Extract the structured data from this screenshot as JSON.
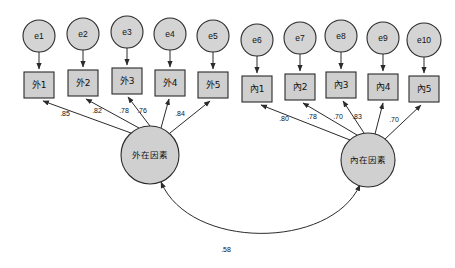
{
  "diagram": {
    "type": "sem-path-diagram",
    "background_color": "#ffffff",
    "stroke_color": "#2b2b2b",
    "node_fill": "#d0d0d0"
  },
  "factors": [
    {
      "id": "left-factor",
      "label": "外在因素",
      "cx": 150,
      "cy": 155,
      "r": 29
    },
    {
      "id": "right-factor",
      "label": "內在因素",
      "cx": 368,
      "cy": 160,
      "r": 27
    }
  ],
  "errors": [
    {
      "label": "e1",
      "cx": 39,
      "cy": 36,
      "r": 16
    },
    {
      "label": "e2",
      "cx": 83,
      "cy": 34,
      "r": 16
    },
    {
      "label": "e3",
      "cx": 127,
      "cy": 32,
      "r": 16
    },
    {
      "label": "e4",
      "cx": 170,
      "cy": 34,
      "r": 16
    },
    {
      "label": "e5",
      "cx": 213,
      "cy": 36,
      "r": 16
    },
    {
      "label": "e6",
      "cx": 257,
      "cy": 40,
      "r": 16
    },
    {
      "label": "e7",
      "cx": 300,
      "cy": 38,
      "r": 16
    },
    {
      "label": "e8",
      "cx": 341,
      "cy": 36,
      "r": 16
    },
    {
      "label": "e9",
      "cx": 383,
      "cy": 38,
      "r": 16
    },
    {
      "label": "e10",
      "cx": 424,
      "cy": 40,
      "r": 17
    }
  ],
  "indicators": [
    {
      "label": "外1",
      "x": 24,
      "y": 72,
      "w": 30,
      "h": 26
    },
    {
      "label": "外2",
      "x": 68,
      "y": 70,
      "w": 30,
      "h": 26
    },
    {
      "label": "外3",
      "x": 112,
      "y": 68,
      "w": 30,
      "h": 26
    },
    {
      "label": "外4",
      "x": 155,
      "y": 70,
      "w": 30,
      "h": 26
    },
    {
      "label": "外5",
      "x": 198,
      "y": 72,
      "w": 30,
      "h": 26
    },
    {
      "label": "內1",
      "x": 242,
      "y": 76,
      "w": 30,
      "h": 26
    },
    {
      "label": "內2",
      "x": 285,
      "y": 74,
      "w": 30,
      "h": 26
    },
    {
      "label": "內3",
      "x": 326,
      "y": 72,
      "w": 30,
      "h": 26
    },
    {
      "label": "內4",
      "x": 368,
      "y": 74,
      "w": 30,
      "h": 26
    },
    {
      "label": "內5",
      "x": 409,
      "y": 76,
      "w": 30,
      "h": 26
    }
  ],
  "loadings": [
    {
      "from": "left-factor",
      "to": "外1",
      "value": ".85",
      "lx": 65,
      "ly": 113
    },
    {
      "from": "left-factor",
      "to": "外2",
      "value": ".82",
      "lx": 97,
      "ly": 110
    },
    {
      "from": "left-factor",
      "to": "外3",
      "value": ".78",
      "lx": 124,
      "ly": 110
    },
    {
      "from": "left-factor",
      "to": "外4",
      "value": ".76",
      "lx": 142,
      "ly": 110
    },
    {
      "from": "left-factor",
      "to": "外5",
      "value": ".84",
      "lx": 180,
      "ly": 113
    },
    {
      "from": "right-factor",
      "to": "內1",
      "value": ".80",
      "lx": 284,
      "ly": 118
    },
    {
      "from": "right-factor",
      "to": "內2",
      "value": ".78",
      "lx": 312,
      "ly": 116
    },
    {
      "from": "right-factor",
      "to": "內3",
      "value": ".70",
      "lx": 338,
      "ly": 116
    },
    {
      "from": "right-factor",
      "to": "內4",
      "value": ".83",
      "lx": 357,
      "ly": 116
    },
    {
      "from": "right-factor",
      "to": "內5",
      "value": ".70",
      "lx": 394,
      "ly": 119
    }
  ],
  "covariance": {
    "between": [
      "外在因素",
      "內在因素"
    ],
    "value": ".58",
    "label_x": 226,
    "label_y": 249
  }
}
